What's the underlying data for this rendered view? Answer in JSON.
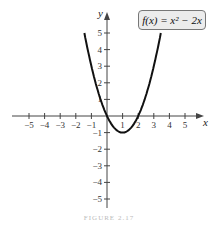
{
  "chart_data": {
    "type": "line",
    "title": "",
    "function_label": "f(x) = x² − 2x",
    "xlabel": "x",
    "ylabel": "y",
    "xlim": [
      -5.5,
      5.5
    ],
    "ylim": [
      -5.5,
      5.5
    ],
    "x_ticks": [
      -5,
      -4,
      -3,
      -2,
      -1,
      1,
      2,
      3,
      4,
      5
    ],
    "y_ticks": [
      -5,
      -4,
      -3,
      -2,
      -1,
      1,
      2,
      3,
      4,
      5
    ],
    "series": [
      {
        "name": "f(x) = x^2 - 2x",
        "x": [
          -1.45,
          -1,
          0,
          1,
          2,
          3,
          3.45
        ],
        "y": [
          5,
          3,
          0,
          -1,
          0,
          3,
          5
        ]
      }
    ],
    "grid": false,
    "legend_position": "top-right"
  },
  "caption": "FIGURE 2.17"
}
